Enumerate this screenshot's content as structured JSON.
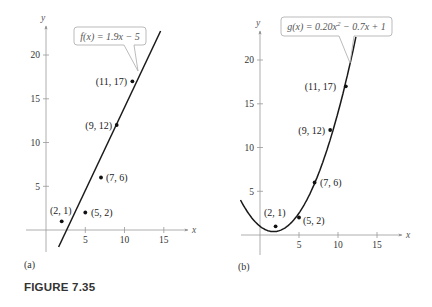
{
  "figure_title": "FIGURE 7.35",
  "panels": [
    {
      "label": "(a)",
      "x_axis_letter": "x",
      "y_axis_letter": "y",
      "x_ticks": [
        "5",
        "10",
        "15"
      ],
      "y_ticks": [
        "5",
        "10",
        "15",
        "20"
      ],
      "callout": "f(x) = 1.9x − 5",
      "points": [
        {
          "label": "(2, 1)"
        },
        {
          "label": "(5, 2)"
        },
        {
          "label": "(7, 6)"
        },
        {
          "label": "(9, 12)"
        },
        {
          "label": "(11, 17)"
        }
      ]
    },
    {
      "label": "(b)",
      "x_axis_letter": "x",
      "y_axis_letter": "y",
      "x_ticks": [
        "5",
        "10",
        "15"
      ],
      "y_ticks": [
        "5",
        "10",
        "15",
        "20"
      ],
      "callout_prefix": "g(x) = 0.20x",
      "callout_exp": "2",
      "callout_suffix": " − 0.7x + 1",
      "points": [
        {
          "label": "(2, 1)"
        },
        {
          "label": "(5, 2)"
        },
        {
          "label": "(7, 6)"
        },
        {
          "label": "(9, 12)"
        },
        {
          "label": "(11, 17)"
        }
      ]
    }
  ],
  "chart_data": [
    {
      "type": "scatter",
      "title": "(a)",
      "xlabel": "x",
      "ylabel": "y",
      "xlim": [
        -3,
        18
      ],
      "ylim": [
        -3,
        23
      ],
      "grid": false,
      "x_ticks": [
        5,
        10,
        15
      ],
      "y_ticks": [
        5,
        10,
        15,
        20
      ],
      "series": [
        {
          "name": "data points",
          "type": "scatter",
          "x": [
            2,
            5,
            7,
            9,
            11
          ],
          "y": [
            1,
            2,
            6,
            12,
            17
          ]
        },
        {
          "name": "f(x) = 1.9x − 5",
          "type": "line",
          "equation": "1.9x - 5",
          "x_range": [
            1.6,
            14.6
          ]
        }
      ],
      "annotations": [
        "f(x) = 1.9x − 5",
        "(2, 1)",
        "(5, 2)",
        "(7, 6)",
        "(9, 12)",
        "(11, 17)"
      ]
    },
    {
      "type": "scatter",
      "title": "(b)",
      "xlabel": "x",
      "ylabel": "y",
      "xlim": [
        -3,
        18
      ],
      "ylim": [
        -3,
        23
      ],
      "grid": false,
      "x_ticks": [
        5,
        10,
        15
      ],
      "y_ticks": [
        5,
        10,
        15,
        20
      ],
      "series": [
        {
          "name": "data points",
          "type": "scatter",
          "x": [
            2,
            5,
            7,
            9,
            11
          ],
          "y": [
            1,
            2,
            6,
            12,
            17
          ]
        },
        {
          "name": "g(x) = 0.20x² − 0.7x + 1",
          "type": "line",
          "equation": "0.20x^2 - 0.7x + 1",
          "x_range": [
            -2.5,
            12.3
          ]
        }
      ],
      "annotations": [
        "g(x) = 0.20x² − 0.7x + 1",
        "(2, 1)",
        "(5, 2)",
        "(7, 6)",
        "(9, 12)",
        "(11, 17)"
      ]
    }
  ]
}
